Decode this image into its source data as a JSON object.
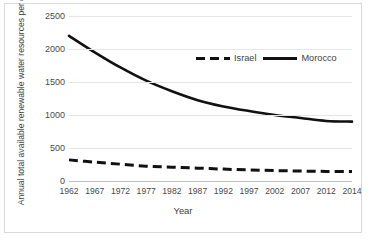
{
  "chart_data": {
    "type": "line",
    "title": "",
    "xlabel": "Year",
    "ylabel": "Annual total available renewable water resources per capita (cubic meter)",
    "x": [
      1962,
      1967,
      1972,
      1977,
      1982,
      1987,
      1992,
      1997,
      2002,
      2007,
      2012,
      2014
    ],
    "xtick_labels": [
      "1962",
      "1967",
      "1972",
      "1977",
      "1982",
      "1987",
      "1992",
      "1997",
      "2002",
      "2007",
      "2012",
      "2014"
    ],
    "ytick_labels": [
      "0",
      "500",
      "1000",
      "1500",
      "2000",
      "2500"
    ],
    "yticks": [
      0,
      500,
      1000,
      1500,
      2000,
      2500
    ],
    "ylim": [
      0,
      2500
    ],
    "grid": true,
    "legend_position": "top-center-right",
    "series": [
      {
        "name": "Israel",
        "style": "dashed",
        "color": "#111111",
        "values": [
          320,
          285,
          255,
          225,
          210,
          195,
          180,
          168,
          158,
          150,
          145,
          143
        ]
      },
      {
        "name": "Morocco",
        "style": "solid",
        "color": "#111111",
        "values": [
          2200,
          1950,
          1720,
          1520,
          1360,
          1225,
          1130,
          1060,
          1000,
          955,
          910,
          900
        ]
      }
    ]
  },
  "legend": {
    "items": [
      {
        "label": "Israel",
        "style": "dashed"
      },
      {
        "label": "Morocco",
        "style": "solid"
      }
    ]
  },
  "axes": {
    "x_title": "Year",
    "y_title": "Annual total available renewable water resources per capita (cubic meter)"
  }
}
